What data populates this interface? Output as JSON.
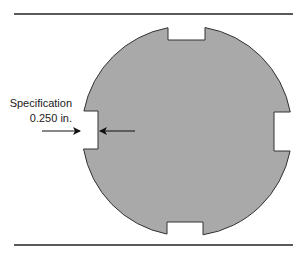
{
  "diagram": {
    "colors": {
      "background": "#ffffff",
      "disc_fill": "#a9a9a9",
      "outline": "#333333",
      "rail": "#222222",
      "arrow": "#111111",
      "text": "#222222"
    },
    "rails": {
      "top": {
        "x1": 14,
        "x2": 293,
        "y": 14
      },
      "bottom": {
        "x1": 14,
        "x2": 293,
        "y": 245
      }
    },
    "disc": {
      "cx": 187,
      "cy": 131,
      "r": 105,
      "notches": [
        {
          "position": "top",
          "x1": 168,
          "x2": 205,
          "depth_to": 40
        },
        {
          "position": "bottom",
          "x1": 167,
          "x2": 203,
          "depth_to": 222
        },
        {
          "position": "left",
          "y1": 111,
          "y2": 149,
          "depth_to": 98
        },
        {
          "position": "right",
          "y1": 112,
          "y2": 151,
          "depth_to": 274
        }
      ]
    },
    "callout": {
      "line1": "Specification",
      "line2": "0.250 in.",
      "target": "left notch width",
      "arrows": [
        {
          "direction": "right",
          "x1": 42,
          "x2": 80,
          "y": 131
        },
        {
          "direction": "left",
          "x1": 135,
          "x2": 100,
          "y": 131
        }
      ]
    }
  }
}
